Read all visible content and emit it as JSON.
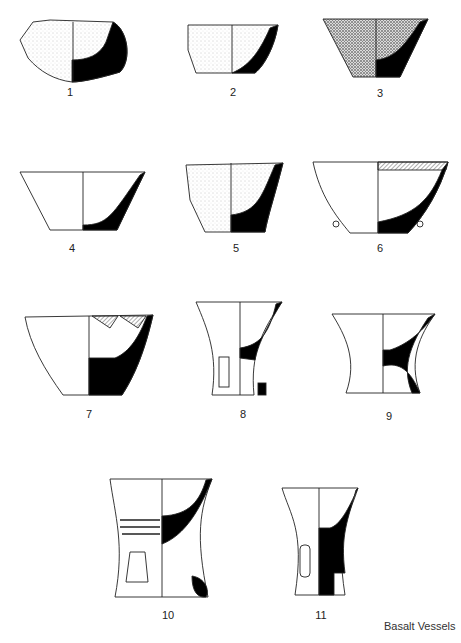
{
  "figure": {
    "caption": "Basalt Vessels",
    "labels": [
      "1",
      "2",
      "3",
      "4",
      "5",
      "6",
      "7",
      "8",
      "9",
      "10",
      "11"
    ]
  },
  "vessels": [
    {
      "number": "1",
      "type": "bowl fragment",
      "fill": "stippled"
    },
    {
      "number": "2",
      "type": "bowl fragment",
      "fill": "stippled"
    },
    {
      "number": "3",
      "type": "flared bowl",
      "fill": "dense stipple"
    },
    {
      "number": "4",
      "type": "open bowl"
    },
    {
      "number": "5",
      "type": "deep bowl",
      "fill": "light stipple"
    },
    {
      "number": "6",
      "type": "bowl with lugs",
      "decoration": "hatched triangles"
    },
    {
      "number": "7",
      "type": "open bowl",
      "decoration": "hatched triangles"
    },
    {
      "number": "8",
      "type": "fenestrated stand"
    },
    {
      "number": "9",
      "type": "fenestrated stand"
    },
    {
      "number": "10",
      "type": "fenestrated stand",
      "decoration": "grooved bands"
    },
    {
      "number": "11",
      "type": "fenestrated stand"
    }
  ],
  "colors": {
    "ink": "#000000",
    "paper": "#ffffff",
    "stipple": "#9a9a9a"
  }
}
